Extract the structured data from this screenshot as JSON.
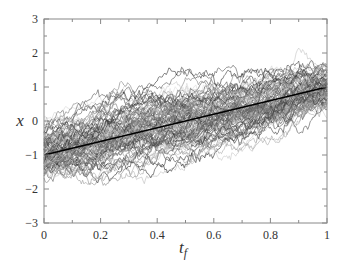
{
  "chart_data": {
    "type": "line",
    "title": "",
    "xlabel": "t",
    "xlabel_subscript": "f",
    "ylabel": "x",
    "xlim": [
      0,
      1
    ],
    "ylim": [
      -3,
      3
    ],
    "x_ticks": [
      0,
      0.2,
      0.4,
      0.6,
      0.8,
      1
    ],
    "x_tick_labels": [
      "0",
      "0.2",
      "0.4",
      "0.6",
      "0.8",
      "1"
    ],
    "x_minor_step": 0.1,
    "y_ticks": [
      -3,
      -2,
      -1,
      0,
      1,
      2,
      3
    ],
    "y_tick_labels": [
      "−3",
      "−2",
      "−1",
      "0",
      "1",
      "2",
      "3"
    ],
    "y_minor_step": 0.5,
    "grid": false,
    "legend": "none",
    "mean_line": {
      "name": "mean path",
      "x": [
        0,
        1
      ],
      "y": [
        -1,
        1
      ],
      "color": "#000000"
    },
    "sample_paths": {
      "description": "ensemble of stochastic (Brownian-like) trajectories in grayscale",
      "count": 100,
      "start_mean": -1,
      "end_mean": 1,
      "start_spread": [
        -2.0,
        -0.3
      ],
      "end_spread": [
        0.3,
        1.6
      ],
      "observed_envelope": {
        "t": [
          0,
          0.1,
          0.2,
          0.3,
          0.4,
          0.5,
          0.6,
          0.7,
          0.8,
          0.9,
          1.0
        ],
        "upper": [
          -0.3,
          0.6,
          1.0,
          1.6,
          1.8,
          2.2,
          2.5,
          2.2,
          2.0,
          1.8,
          1.2
        ],
        "lower": [
          -1.9,
          -2.3,
          -2.2,
          -2.4,
          -2.4,
          -2.5,
          -2.2,
          -1.9,
          -1.2,
          -0.7,
          0.4
        ]
      },
      "gray_range": [
        "#222222",
        "#dddddd"
      ]
    }
  }
}
